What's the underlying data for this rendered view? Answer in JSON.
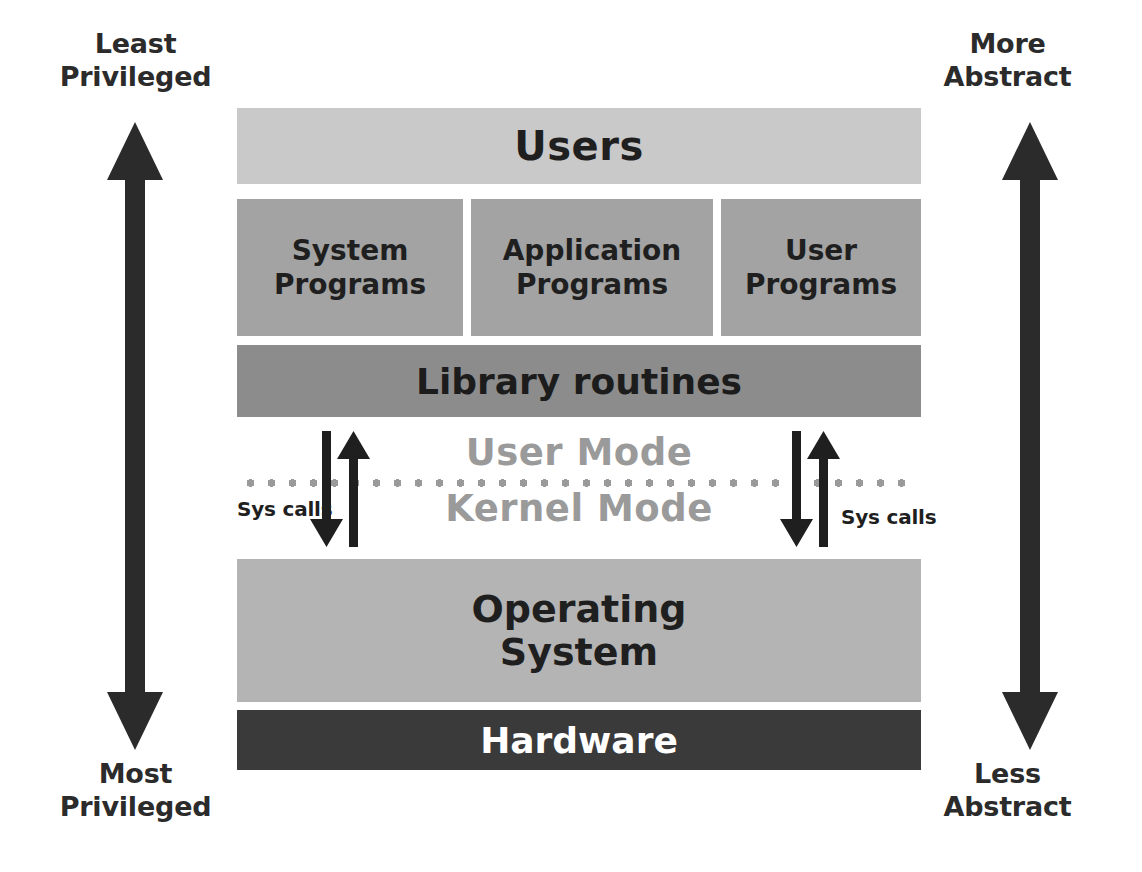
{
  "diagram": {
    "background_color": "#ffffff",
    "axes": {
      "left": {
        "top_label": "Least\nPrivileged",
        "bottom_label": "Most\nPrivileged",
        "arrow_name": "privilege-axis-arrow",
        "arrow_color": "#2b2b2b",
        "direction": "double-headed-vertical"
      },
      "right": {
        "top_label": "More\nAbstract",
        "bottom_label": "Less\nAbstract",
        "arrow_name": "abstraction-axis-arrow",
        "arrow_color": "#2b2b2b",
        "direction": "double-headed-vertical"
      }
    },
    "layers": [
      {
        "id": "users",
        "label": "Users",
        "fill": "#c9c9c9",
        "text_color": "#1f1f1f"
      },
      {
        "id": "system-programs",
        "label": "System\nPrograms",
        "fill": "#a3a3a3",
        "text_color": "#1f1f1f"
      },
      {
        "id": "application-programs",
        "label": "Application\nPrograms",
        "fill": "#a3a3a3",
        "text_color": "#1f1f1f"
      },
      {
        "id": "user-programs",
        "label": "User\nPrograms",
        "fill": "#a3a3a3",
        "text_color": "#1f1f1f"
      },
      {
        "id": "library-routines",
        "label": "Library routines",
        "fill": "#8c8c8c",
        "text_color": "#1c1c1c"
      },
      {
        "id": "operating-system",
        "label": "Operating\nSystem",
        "fill": "#b4b4b4",
        "text_color": "#1f1f1f"
      },
      {
        "id": "hardware",
        "label": "Hardware",
        "fill": "#3a3a3a",
        "text_color": "#ffffff"
      }
    ],
    "mode_band": {
      "upper_mode": "User Mode",
      "lower_mode": "Kernel Mode",
      "mode_text_color": "#9a9a9a",
      "divider_style": "dotted",
      "divider_color": "#9a9a9a",
      "syscalls_left_label": "Sys calls",
      "syscalls_right_label": "Sys calls",
      "arrow_color": "#1f1f1f",
      "arrow_pair": [
        "down",
        "up"
      ]
    }
  }
}
